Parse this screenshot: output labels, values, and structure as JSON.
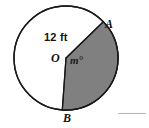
{
  "figure": {
    "colors": {
      "stroke": "#1a1a1a",
      "circle_fill": "#ffffff",
      "sector_fill": "#808080",
      "background": "#ffffff",
      "rule": "#b4b4b4"
    },
    "circle": {
      "center_x": 66,
      "center_y": 58,
      "radius_px": 52,
      "radius_label": "12 ft"
    },
    "labels": {
      "radius": "12 ft",
      "center": "O",
      "angle": "m°",
      "point_a": "A",
      "point_b": "B"
    },
    "points": {
      "A": {
        "x": 103,
        "y": 33
      },
      "B": {
        "x": 62,
        "y": 110
      },
      "O": {
        "x": 66,
        "y": 58
      }
    },
    "shaded_sector": {
      "from_point": "A",
      "to_point": "B",
      "fill": "#808080"
    }
  },
  "answer_rule": {
    "present": true,
    "x": 118,
    "y": 113,
    "width": 28
  }
}
